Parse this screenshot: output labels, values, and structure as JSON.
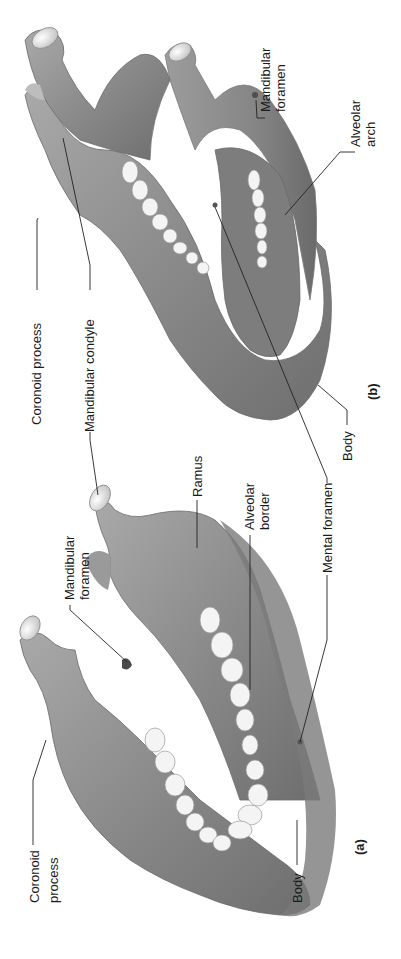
{
  "figure": {
    "orientation": "rotated -90deg",
    "panels": [
      {
        "id": "a",
        "panel_label": "(a)",
        "view": "lateral view of mandible",
        "labels": {
          "coronoid_process_1": "Coronoid",
          "coronoid_process_2": "process",
          "mandibular_foramen_1": "Mandibular",
          "mandibular_foramen_2": "foramen",
          "ramus": "Ramus",
          "alveolar_border_1": "Alveolar",
          "alveolar_border_2": "border",
          "mental_foramen": "Mental foramen",
          "body": "Body"
        }
      },
      {
        "id": "b",
        "panel_label": "(b)",
        "view": "oblique view of mandible",
        "labels": {
          "coronoid_process": "Coronoid process",
          "mandibular_condyle": "Mandibular condyle",
          "mandibular_foramen_1": "Mandibular",
          "mandibular_foramen_2": "foramen",
          "alveolar_arch_1": "Alveolar",
          "alveolar_arch_2": "arch",
          "body": "Body"
        }
      }
    ],
    "colors": {
      "bone": "#8f8f8f",
      "bone_light": "#c4c4c4",
      "bone_dark": "#5e5e5e",
      "teeth": "#f2f2f2",
      "leader_line": "#222222",
      "background": "#ffffff"
    }
  }
}
